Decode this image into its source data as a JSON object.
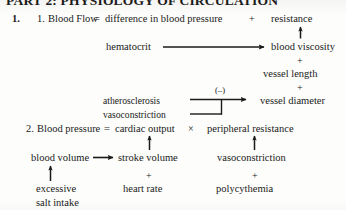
{
  "page": {
    "heading": "PART 2: PHYSIOLOGY OF CIRCULATION",
    "outline_number": "1.",
    "background_color": "#fdfdfc",
    "ink_color": "#1a1a18"
  },
  "equation1": {
    "number": "1.",
    "subject": "Blood Flow",
    "equals": "=",
    "term1": "difference in blood pressure",
    "operator": "+",
    "term2": "resistance"
  },
  "equation1_factors": {
    "hematocrit": "hematocrit",
    "blood_viscosity": "blood viscosity",
    "plus_1": "+",
    "vessel_length": "vessel length",
    "plus_2": "+",
    "vessel_diameter": "vessel diameter",
    "plus_3": "+",
    "atherosclerosis": "atherosclerosis",
    "vasoconstriction": "vasoconstriction",
    "negative_sign": "(–)"
  },
  "equation2": {
    "number": "2.",
    "subject": "Blood pressure",
    "equals": "=",
    "term1": "cardiac output",
    "operator": "×",
    "term2": "peripheral resistance"
  },
  "equation2_factors": {
    "blood_volume": "blood volume",
    "stroke_volume": "stroke volume",
    "plus_1": "+",
    "heart_rate": "heart rate",
    "vasoconstriction": "vasoconstriction",
    "plus_2": "+",
    "polycythemia": "polycythemia",
    "excessive": "excessive",
    "salt_intake": "salt intake"
  },
  "icons": {
    "arrow_up": "arrow-up-icon",
    "arrow_right": "arrow-right-icon",
    "bracket_join": "bracket-join-icon"
  }
}
